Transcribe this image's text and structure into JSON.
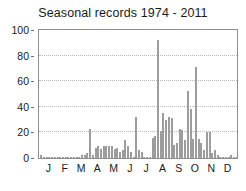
{
  "chart": {
    "title": "Seasonal records 1974 - 2011",
    "background_color": "#ffffff",
    "bar_color": "#b6b6b6",
    "bar_edge_color": "#9d9d9d",
    "frame_color": "#8e8e8e",
    "grid_color": "#b9b9b9",
    "text_color": "#1a1a1a"
  },
  "chart_data": {
    "type": "bar",
    "title": "Seasonal records 1974 - 2011",
    "xlabel": "",
    "ylabel": "",
    "ylim": [
      0,
      100
    ],
    "yticks": [
      0,
      20,
      40,
      60,
      80,
      100
    ],
    "grid": true,
    "legend": "none",
    "x_tick_labels": [
      "J",
      "F",
      "M",
      "A",
      "M",
      "J",
      "J",
      "A",
      "S",
      "O",
      "N",
      "D"
    ],
    "x_tick_positions": [
      3,
      9,
      15,
      21,
      27,
      33,
      39,
      45,
      51,
      57,
      63,
      69
    ],
    "x_description": "Pentad (5-day period) of the year, 73 bins, labelled by month",
    "categories": [
      1,
      2,
      3,
      4,
      5,
      6,
      7,
      8,
      9,
      10,
      11,
      12,
      13,
      14,
      15,
      16,
      17,
      18,
      19,
      20,
      21,
      22,
      23,
      24,
      25,
      26,
      27,
      28,
      29,
      30,
      31,
      32,
      33,
      34,
      35,
      36,
      37,
      38,
      39,
      40,
      41,
      42,
      43,
      44,
      45,
      46,
      47,
      48,
      49,
      50,
      51,
      52,
      53,
      54,
      55,
      56,
      57,
      58,
      59,
      60,
      61,
      62,
      63,
      64,
      65,
      66,
      67,
      68,
      69,
      70,
      71,
      72,
      73
    ],
    "values": [
      2,
      1,
      0,
      0,
      1,
      0,
      0,
      0,
      0,
      0,
      0,
      1,
      1,
      0,
      1,
      2,
      2,
      4,
      23,
      2,
      8,
      9,
      7,
      9,
      9,
      9,
      9,
      7,
      8,
      5,
      6,
      14,
      9,
      5,
      1,
      32,
      6,
      5,
      1,
      1,
      1,
      16,
      17,
      44,
      21,
      35,
      30,
      32,
      31,
      10,
      12,
      23,
      22,
      14,
      52,
      38,
      15,
      71,
      15,
      12,
      6,
      20,
      20,
      4,
      6,
      2,
      1,
      1,
      1,
      1,
      2,
      0,
      1
    ],
    "peak_values": [
      {
        "label": "July peak",
        "value": 92
      },
      {
        "label": "August peak",
        "value": 71
      },
      {
        "label": "late July peak",
        "value": 52
      }
    ]
  }
}
